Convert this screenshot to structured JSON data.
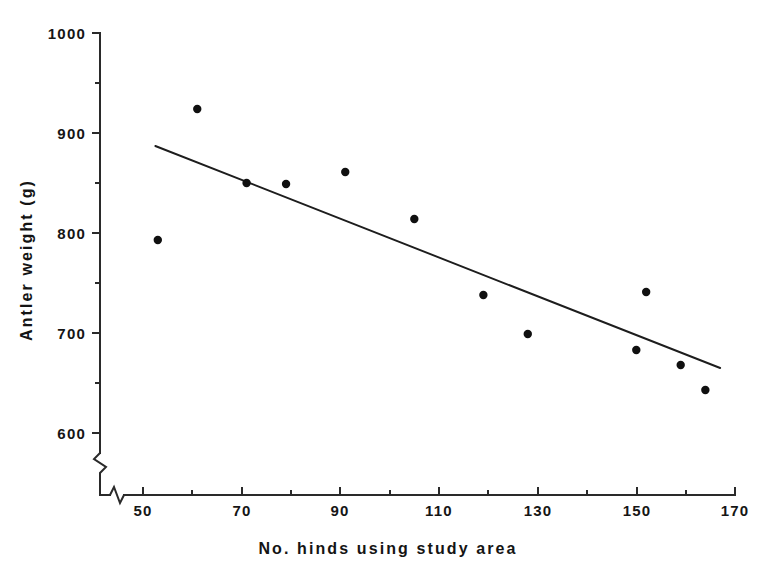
{
  "chart_data": {
    "type": "scatter",
    "title": "",
    "xlabel": "No. hinds using study area",
    "ylabel": "Antler weight (g)",
    "xlim": [
      45,
      170
    ],
    "ylim": [
      565,
      1000
    ],
    "grid": false,
    "legend": null,
    "axis_break": {
      "x": true,
      "y": true,
      "note": "zigzag break marks near origin on both axes"
    },
    "x_ticks_major": [
      50,
      70,
      90,
      110,
      130,
      150,
      170
    ],
    "x_ticks_minor": [
      60,
      80,
      100,
      120,
      140,
      160
    ],
    "y_ticks_major": [
      600,
      700,
      800,
      900,
      1000
    ],
    "y_ticks_minor": [
      650,
      750,
      850,
      950
    ],
    "x_tick_labels": [
      "50",
      "70",
      "90",
      "110",
      "130",
      "150",
      "170"
    ],
    "y_tick_labels": [
      "600",
      "700",
      "800",
      "900",
      "1000"
    ],
    "points": [
      {
        "x": 53,
        "y": 793
      },
      {
        "x": 61,
        "y": 924
      },
      {
        "x": 71,
        "y": 850
      },
      {
        "x": 79,
        "y": 849
      },
      {
        "x": 91,
        "y": 861
      },
      {
        "x": 105,
        "y": 814
      },
      {
        "x": 119,
        "y": 738
      },
      {
        "x": 128,
        "y": 699
      },
      {
        "x": 150,
        "y": 683
      },
      {
        "x": 152,
        "y": 741
      },
      {
        "x": 159,
        "y": 668
      },
      {
        "x": 164,
        "y": 643
      }
    ],
    "series": [
      {
        "name": "Antler weight vs. number of hinds",
        "marker": "filled-circle",
        "color": "#101010",
        "values": [
          793,
          924,
          850,
          849,
          861,
          814,
          738,
          699,
          683,
          741,
          668,
          643
        ]
      }
    ],
    "fit_line": {
      "type": "linear-regression",
      "x_start": 52.5,
      "y_start": 887,
      "x_end": 167,
      "y_end": 665,
      "color": "#1d1d1d"
    }
  }
}
